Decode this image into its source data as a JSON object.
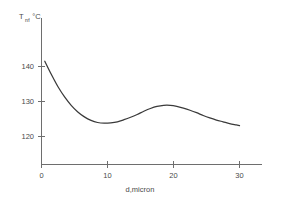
{
  "chart_data": {
    "type": "line",
    "title": "",
    "subtitle": "",
    "xlabel": "d,micron",
    "ylabel_main": "T",
    "ylabel_subscript": "m",
    "ylabel_units": ", °C",
    "ylabel_full": "Tₘ, °C",
    "xlim": [
      0,
      33
    ],
    "ylim": [
      114,
      146
    ],
    "xticks": [
      0,
      10,
      20,
      30
    ],
    "xticklabels": [
      "0",
      "10",
      "20",
      "30"
    ],
    "yticks": [
      120,
      130,
      140
    ],
    "yticklabels": [
      "120",
      "130",
      "140"
    ],
    "grid": false,
    "legend": null,
    "series": [
      {
        "name": "melting temperature vs lamella thickness",
        "x": [
          0.5,
          1.5,
          2.5,
          3.5,
          4.5,
          5.5,
          6.5,
          7.5,
          8.5,
          9.5,
          10.5,
          11.5,
          12.5,
          13.5,
          14.5,
          15.5,
          16.5,
          17.5,
          18.5,
          19.5,
          20.5,
          21.5,
          22.5,
          23.5,
          24.5,
          25.5,
          26.5,
          27.5,
          28.5,
          29.5,
          30.0
        ],
        "y": [
          141.5,
          137.7,
          134.2,
          131.3,
          128.9,
          127.0,
          125.6,
          124.6,
          124.0,
          123.8,
          123.9,
          124.2,
          124.8,
          125.5,
          126.3,
          127.2,
          128.0,
          128.6,
          128.9,
          128.9,
          128.6,
          128.1,
          127.5,
          126.8,
          126.0,
          125.3,
          124.7,
          124.2,
          123.7,
          123.3,
          123.1
        ]
      }
    ],
    "annotations": {
      "minimum": {
        "x": 9.5,
        "y": 123.8
      },
      "local_maximum": {
        "x": 18.8,
        "y": 128.9
      },
      "start": {
        "x": 0.5,
        "y": 141.5
      },
      "end": {
        "x": 30.0,
        "y": 123.1
      }
    },
    "colors": {
      "curve": "#3a3a3a",
      "axis": "#6e6e6e",
      "text": "#4a4a4a",
      "background": "#ffffff"
    }
  }
}
